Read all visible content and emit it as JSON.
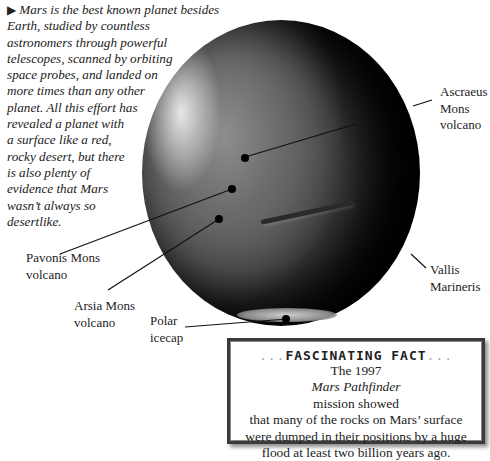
{
  "intro": {
    "bullet_icon": "right-triangle-bullet",
    "lines": [
      "Mars is the best known planet besides",
      "Earth, studied by countless",
      "astronomers through powerful",
      "telescopes, scanned by orbiting",
      "space probes, and landed on",
      "more times than any other",
      "planet. All this effort has",
      "revealed a planet with",
      "a surface like a red,",
      "rocky desert, but there",
      "is also plenty of",
      "evidence that Mars",
      "wasn’t always so",
      "desertlike."
    ]
  },
  "labels": {
    "ascraeus": [
      "Ascraeus",
      "Mons",
      "volcano"
    ],
    "pavonis": [
      "Pavonis Mons",
      "volcano"
    ],
    "arsia": [
      "Arsia Mons",
      "volcano"
    ],
    "vallis": [
      "Vallis",
      "Marineris"
    ],
    "polar": [
      "Polar",
      "icecap"
    ]
  },
  "fact_box": {
    "dots_left": "...",
    "title": "FASCINATING FACT",
    "dots_right": "...",
    "line1_pre": "The 1997 ",
    "line1_italic": "Mars Pathfinder",
    "line1_post": " mission showed",
    "line2": "that many of the rocks on Mars’ surface",
    "line3": "were dumped in their positions by a huge",
    "line4": "flood at least two billion years ago."
  }
}
